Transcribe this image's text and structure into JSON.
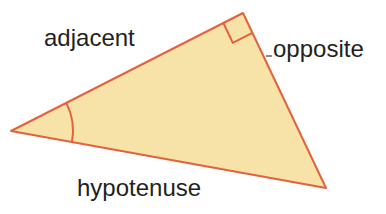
{
  "figure": {
    "kind": "right-triangle-diagram",
    "background_color": "#ffffff",
    "fill_color": "#F7E2A8",
    "stroke_color": "#E6603C",
    "stroke_width": 2,
    "label_color": "#231f20",
    "tick_color": "#8d8d8d",
    "vertices": {
      "left": [
        11,
        131
      ],
      "top": [
        243,
        13
      ],
      "bottom_right": [
        326,
        188
      ]
    },
    "right_angle_marker": {
      "at_vertex": "top",
      "size": 22
    },
    "angle_arc": {
      "at_vertex": "left",
      "radius": 62
    }
  },
  "labels": {
    "adjacent": "adjacent",
    "opposite": "opposite",
    "hypotenuse": "hypotenuse"
  }
}
